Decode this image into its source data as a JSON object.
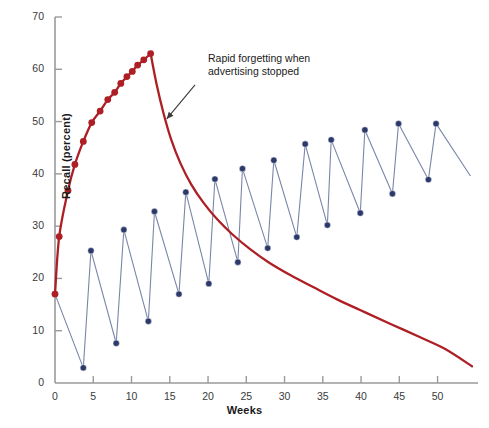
{
  "chart_data": {
    "type": "line",
    "title": "",
    "xlabel": "Weeks",
    "ylabel": "Recall (percent)",
    "xlim": [
      0,
      54.5
    ],
    "ylim": [
      0,
      70
    ],
    "xticks": [
      0,
      5,
      10,
      15,
      20,
      25,
      30,
      35,
      40,
      45,
      50
    ],
    "yticks": [
      0,
      10,
      20,
      30,
      40,
      50,
      60,
      70
    ],
    "grid": false,
    "legend": "none",
    "annotations": [
      {
        "text": "Rapid forgetting when\nadvertising stopped",
        "x": 18.7,
        "y": 58.5,
        "arrow_from": [
          18.3,
          57.0
        ],
        "arrow_to": [
          14.6,
          50.5
        ]
      }
    ],
    "series": [
      {
        "name": "Continuous advertising then stopped",
        "color": "#AD1F24",
        "marker": "circle",
        "marker_color": "#AD1F24",
        "markers_until_x": 12.5,
        "points": [
          {
            "x": 0.0,
            "y": 17.0
          },
          {
            "x": 0.55,
            "y": 28.0
          },
          {
            "x": 1.7,
            "y": 36.8
          },
          {
            "x": 2.6,
            "y": 41.8
          },
          {
            "x": 3.7,
            "y": 46.2
          },
          {
            "x": 4.8,
            "y": 49.8
          },
          {
            "x": 5.9,
            "y": 52.0
          },
          {
            "x": 6.9,
            "y": 54.2
          },
          {
            "x": 7.8,
            "y": 55.6
          },
          {
            "x": 8.6,
            "y": 57.3
          },
          {
            "x": 9.4,
            "y": 58.6
          },
          {
            "x": 10.1,
            "y": 59.6
          },
          {
            "x": 10.8,
            "y": 60.8
          },
          {
            "x": 11.6,
            "y": 61.8
          },
          {
            "x": 12.5,
            "y": 63.0
          },
          {
            "x": 13.3,
            "y": 57.0
          },
          {
            "x": 14.2,
            "y": 51.5
          },
          {
            "x": 15.2,
            "y": 46.5
          },
          {
            "x": 16.4,
            "y": 42.0
          },
          {
            "x": 17.8,
            "y": 38.0
          },
          {
            "x": 19.4,
            "y": 34.5
          },
          {
            "x": 21.2,
            "y": 31.3
          },
          {
            "x": 23.2,
            "y": 28.4
          },
          {
            "x": 25.5,
            "y": 25.6
          },
          {
            "x": 28.0,
            "y": 23.0
          },
          {
            "x": 30.8,
            "y": 20.6
          },
          {
            "x": 33.8,
            "y": 18.3
          },
          {
            "x": 37.0,
            "y": 15.9
          },
          {
            "x": 40.4,
            "y": 13.6
          },
          {
            "x": 44.0,
            "y": 11.2
          },
          {
            "x": 47.8,
            "y": 8.7
          },
          {
            "x": 51.0,
            "y": 6.5
          },
          {
            "x": 54.5,
            "y": 3.2
          }
        ]
      },
      {
        "name": "Pulsed advertising",
        "color": "#2C3A6B",
        "line_color": "#7a86a8",
        "marker": "circle",
        "marker_color": "#2C3A6B",
        "points": [
          {
            "x": 0.0,
            "y": 17.0
          },
          {
            "x": 3.7,
            "y": 2.9
          },
          {
            "x": 4.7,
            "y": 25.3
          },
          {
            "x": 8.0,
            "y": 7.6
          },
          {
            "x": 9.0,
            "y": 29.3
          },
          {
            "x": 12.2,
            "y": 11.8
          },
          {
            "x": 13.0,
            "y": 32.8
          },
          {
            "x": 16.2,
            "y": 17.0
          },
          {
            "x": 17.1,
            "y": 36.5
          },
          {
            "x": 20.1,
            "y": 19.0
          },
          {
            "x": 20.9,
            "y": 39.0
          },
          {
            "x": 23.9,
            "y": 23.1
          },
          {
            "x": 24.5,
            "y": 41.0
          },
          {
            "x": 27.8,
            "y": 25.8
          },
          {
            "x": 28.6,
            "y": 42.6
          },
          {
            "x": 31.6,
            "y": 27.9
          },
          {
            "x": 32.7,
            "y": 45.7
          },
          {
            "x": 35.6,
            "y": 30.2
          },
          {
            "x": 36.1,
            "y": 46.5
          },
          {
            "x": 39.9,
            "y": 32.5
          },
          {
            "x": 40.5,
            "y": 48.4
          },
          {
            "x": 44.1,
            "y": 36.2
          },
          {
            "x": 44.9,
            "y": 49.6
          },
          {
            "x": 48.8,
            "y": 38.9
          },
          {
            "x": 49.8,
            "y": 49.6
          },
          {
            "x": 54.3,
            "y": 39.6
          }
        ],
        "last_point_has_marker": false
      }
    ]
  },
  "axes": {
    "y_tick_labels": [
      "70",
      "60",
      "50",
      "40",
      "30",
      "20",
      "10",
      "0"
    ],
    "x_tick_labels": [
      "0",
      "5",
      "10",
      "15",
      "20",
      "25",
      "30",
      "35",
      "40",
      "45",
      "50"
    ],
    "axis_color": "#9a9a9a"
  }
}
